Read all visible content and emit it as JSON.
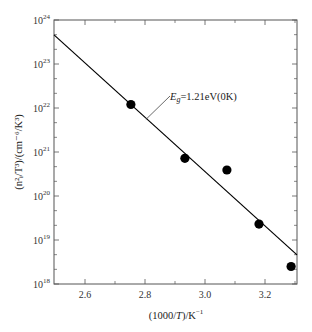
{
  "chart_data": {
    "type": "scatter",
    "title": "",
    "xlabel": "(1000/T)/K⁻¹",
    "ylabel": "(n²ᵢ/T³)/(cm⁻⁶/K³)",
    "xlim": [
      2.5,
      3.31
    ],
    "ylim": [
      1e+18,
      1e+24
    ],
    "yscale": "log",
    "x_ticks": [
      2.6,
      2.8,
      3.0,
      3.2
    ],
    "x_tick_labels": [
      "2.6",
      "2.8",
      "3.0",
      "3.2"
    ],
    "x_minor_ticks": [
      2.7,
      2.9,
      3.1,
      3.3
    ],
    "y_ticks_exponents": [
      18,
      19,
      20,
      21,
      22,
      23,
      24
    ],
    "y_tick_base": "10",
    "grid": false,
    "legend": null,
    "series": [
      {
        "name": "measured",
        "kind": "scatter",
        "marker": "filled-circle",
        "color": "#000000",
        "x": [
          2.753,
          2.933,
          3.073,
          3.18,
          3.287
        ],
        "y": [
          1.2e+22,
          7.2e+20,
          3.9e+20,
          2.3e+19,
          2.5e+18
        ]
      },
      {
        "name": "fit",
        "kind": "line",
        "color": "#000000",
        "x": [
          2.5,
          3.307
        ],
        "y": [
          4.6e+23,
          4.6e+18
        ]
      }
    ],
    "annotations": [
      {
        "text_main": "E",
        "text_sub": "g",
        "text_rest": "=1.21eV(0K)",
        "x": 2.88,
        "y": 2e+22,
        "points_to": {
          "x": 2.803,
          "y": 5.5e+21
        }
      }
    ]
  },
  "labels": {
    "xlabel_prefix": "(1000/",
    "xlabel_var": "T",
    "xlabel_suffix": ")/K",
    "xlabel_sup": "−1",
    "ylabel_text": "(n²ᵢ/T³)/(cm⁻⁶/K³)",
    "annotation_E": "E",
    "annotation_g": "g",
    "annotation_rest": "=1.21eV(0K)"
  }
}
